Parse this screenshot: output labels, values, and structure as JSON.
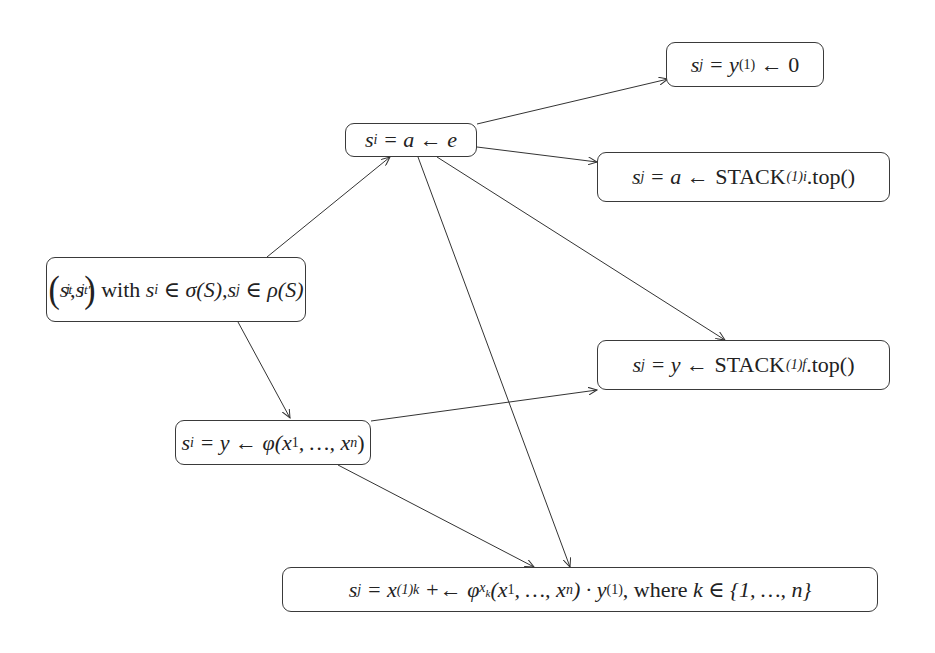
{
  "diagram": {
    "type": "flow-graph",
    "nodes": [
      {
        "id": "root",
        "label": "(s_i^t, s_j^{t'}) with s_i ∈ σ(S), s_j ∈ ρ(S)",
        "parts": {
          "open": "(",
          "s": "s",
          "i": "i",
          "t": "t",
          "comma": ",",
          "j": "j",
          "tprime": "t′",
          "close": ")",
          "with": "with",
          "member1": "s",
          "sub_i": "i",
          "in1": "∈",
          "sigma": "σ(S), ",
          "member2": "s",
          "sub_j": "j",
          "in2": "∈",
          "rho": "ρ(S)"
        }
      },
      {
        "id": "assign_a",
        "label": "s_i = a ← e",
        "parts": {
          "s": "s",
          "sub": "i",
          "rest": " = a ← e"
        }
      },
      {
        "id": "y1_zero",
        "label": "s_j = y_(1) ← 0",
        "parts": {
          "s": "s",
          "sub": "j",
          "eq": " = y",
          "ysub": "(1)",
          "rest": " ← 0"
        }
      },
      {
        "id": "stack_i",
        "label": "s_j = a ← STACK_(1)i.top()",
        "parts": {
          "s": "s",
          "sub": "j",
          "eq": " = a ← ",
          "stack": "STACK",
          "stacksub": "(1)i",
          "top": ".top()"
        }
      },
      {
        "id": "stack_f",
        "label": "s_j = y ← STACK_(1)f.top()",
        "parts": {
          "s": "s",
          "sub": "j",
          "eq": " = y ← ",
          "stack": "STACK",
          "stacksub": "(1)f",
          "top": ".top()"
        }
      },
      {
        "id": "phi",
        "label": "s_i = y ← φ(x_1, ..., x_n)",
        "parts": {
          "s": "s",
          "sub": "i",
          "eq": " = y ← φ(x",
          "x1": "1",
          "mid": ", …, x",
          "xn": "n",
          "close": ")"
        }
      },
      {
        "id": "grad",
        "label": "s_j = x_(1)k +← φ_{x_k}(x_1, ..., x_n) · y_(1), where k ∈ {1, ..., n}",
        "parts": {
          "s": "s",
          "sub": "j",
          "eq": " = x",
          "xsub": "(1)k",
          "op": " +← φ",
          "phisub": "x",
          "phisubsub": "k",
          "args": "(x",
          "x1": "1",
          "mid": ", …, x",
          "xn": "n",
          "close": ") · y",
          "ysub": "(1)",
          "where": ", where ",
          "k": "k ∈ {1, …, n}"
        }
      }
    ],
    "edges": [
      {
        "from": "root",
        "to": "assign_a"
      },
      {
        "from": "root",
        "to": "phi"
      },
      {
        "from": "assign_a",
        "to": "y1_zero"
      },
      {
        "from": "assign_a",
        "to": "stack_i"
      },
      {
        "from": "assign_a",
        "to": "stack_f"
      },
      {
        "from": "assign_a",
        "to": "grad"
      },
      {
        "from": "phi",
        "to": "stack_f"
      },
      {
        "from": "phi",
        "to": "grad"
      }
    ]
  }
}
